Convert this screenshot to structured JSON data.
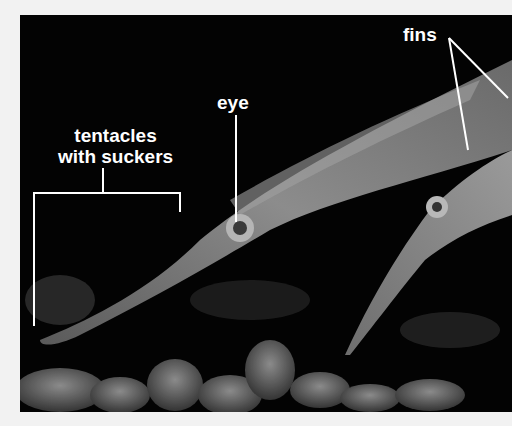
{
  "image": {
    "subject": "squid photograph with anatomical labels",
    "background": "#030303",
    "border": "#f2f2f2"
  },
  "labels": {
    "tentacles_line1": "tentacles",
    "tentacles_line2": "with suckers",
    "eye": "eye",
    "fins": "fins"
  }
}
